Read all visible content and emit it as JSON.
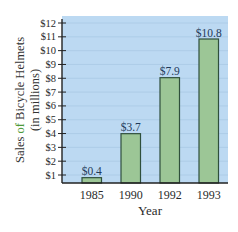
{
  "chart_data": {
    "type": "bar",
    "title": "",
    "xlabel": "Year",
    "ylabel": "Sales of Bicycle Helmets (in millions)",
    "ylabel_lines": [
      "Sales of Bicycle Helmets",
      "(in millions)"
    ],
    "categories": [
      "1985",
      "1990",
      "1992",
      "1993"
    ],
    "values": [
      0.4,
      3.7,
      7.9,
      10.8
    ],
    "data_labels": [
      "$0.4",
      "$3.7",
      "$7.9",
      "$10.8"
    ],
    "ylim": [
      0,
      12.5
    ],
    "yticks": [
      1,
      2,
      3,
      4,
      5,
      6,
      7,
      8,
      9,
      10,
      11,
      12
    ],
    "ytick_labels": [
      "$1",
      "$2",
      "$3",
      "$4",
      "$5",
      "$6",
      "$7",
      "$8",
      "$9",
      "$10",
      "$11",
      "$12"
    ],
    "grid": true,
    "legend": null
  },
  "colors": {
    "plot_background": "#bcd9f2",
    "gridline": "#a9c9e4",
    "bar_fill": "#9cc696",
    "bar_stroke": "#2f4f3c",
    "axis": "#222222",
    "text": "#2a2a2a",
    "data_label": "#1f3a5a",
    "accent_word": "#4e9a3a"
  },
  "labels": {
    "ylabel_part1_a": "Sales ",
    "ylabel_part1_b": "of",
    "ylabel_part1_c": " Bicycle Helmets",
    "ylabel_part2": "(in millions)"
  }
}
